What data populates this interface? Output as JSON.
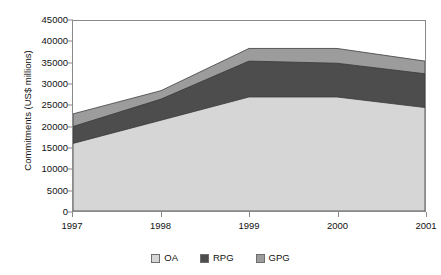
{
  "chart_data": {
    "type": "area",
    "stacked": true,
    "title": "",
    "xlabel": "",
    "ylabel": "Commitments (US$ millions)",
    "x": [
      1997,
      1998,
      1999,
      2000,
      2001
    ],
    "categories": [
      "1997",
      "1998",
      "1999",
      "2000",
      "2001"
    ],
    "xtick_labels": [
      "1997",
      "1998",
      "1999",
      "2000",
      "2001"
    ],
    "ytick_labels": [
      "0",
      "5000",
      "10000",
      "15000",
      "20000",
      "25000",
      "30000",
      "35000",
      "40000",
      "45000"
    ],
    "ytick_values": [
      0,
      5000,
      10000,
      15000,
      20000,
      25000,
      30000,
      35000,
      40000,
      45000
    ],
    "ylim": [
      0,
      45000
    ],
    "xlim": [
      1997,
      2001
    ],
    "grid": false,
    "legend_position": "bottom",
    "series": [
      {
        "name": "OA",
        "color": "#d6d6d6",
        "values": [
          16000,
          21500,
          27000,
          27000,
          24500
        ]
      },
      {
        "name": "RPG",
        "color": "#4d4d4d",
        "values": [
          4000,
          5000,
          8500,
          8000,
          8000
        ]
      },
      {
        "name": "GPG",
        "color": "#9c9c9c",
        "values": [
          3000,
          2000,
          3000,
          3500,
          3000
        ]
      }
    ],
    "cumulative_tops": {
      "OA": [
        16000,
        21500,
        27000,
        27000,
        24500
      ],
      "RPG": [
        20000,
        26500,
        35500,
        35000,
        32500
      ],
      "GPG": [
        23000,
        28500,
        38500,
        38500,
        35500
      ]
    }
  },
  "legend": {
    "items": [
      {
        "label": "OA",
        "color": "#d6d6d6"
      },
      {
        "label": "RPG",
        "color": "#4d4d4d"
      },
      {
        "label": "GPG",
        "color": "#9c9c9c"
      }
    ]
  }
}
